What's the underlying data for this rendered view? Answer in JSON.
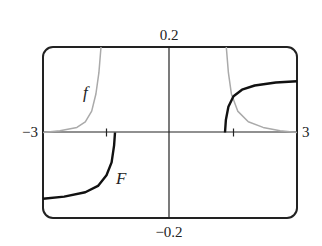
{
  "chart_data": {
    "type": "line",
    "title": "",
    "xlabel": "",
    "ylabel": "",
    "xlim": [
      -3,
      3
    ],
    "ylim": [
      -0.2,
      0.2
    ],
    "grid": false,
    "x_tick_labels": {
      "left": "−3",
      "right": "3"
    },
    "y_tick_labels": {
      "top": "0.2",
      "bottom": "−0.2"
    },
    "x_ticks": [
      -1.5,
      1.5
    ],
    "series": [
      {
        "name": "f",
        "color": "#aaaaaa",
        "segments": [
          [
            [
              -3.0,
              0.0
            ],
            [
              -2.6,
              0.004
            ],
            [
              -2.2,
              0.012
            ],
            [
              -2.0,
              0.025
            ],
            [
              -1.85,
              0.05
            ],
            [
              -1.75,
              0.09
            ],
            [
              -1.68,
              0.14
            ],
            [
              -1.63,
              0.2
            ]
          ],
          [
            [
              1.33,
              0.2
            ],
            [
              1.38,
              0.14
            ],
            [
              1.45,
              0.09
            ],
            [
              1.6,
              0.05
            ],
            [
              1.85,
              0.025
            ],
            [
              2.2,
              0.012
            ],
            [
              2.6,
              0.004
            ],
            [
              3.0,
              0.0
            ]
          ]
        ]
      },
      {
        "name": "F",
        "color": "#111111",
        "segments": [
          [
            [
              -3.0,
              -0.155
            ],
            [
              -2.5,
              -0.15
            ],
            [
              -2.0,
              -0.14
            ],
            [
              -1.7,
              -0.125
            ],
            [
              -1.5,
              -0.1
            ],
            [
              -1.38,
              -0.07
            ],
            [
              -1.32,
              -0.03
            ],
            [
              -1.3,
              0.0
            ]
          ],
          [
            [
              1.3,
              0.0
            ],
            [
              1.32,
              0.03
            ],
            [
              1.38,
              0.06
            ],
            [
              1.5,
              0.085
            ],
            [
              1.7,
              0.1
            ],
            [
              2.0,
              0.11
            ],
            [
              2.5,
              0.117
            ],
            [
              3.0,
              0.12
            ]
          ]
        ]
      }
    ],
    "annotations": [
      {
        "text": "f",
        "x": -2.0,
        "y": 0.08
      },
      {
        "text": "F",
        "x": -1.15,
        "y": -0.12
      }
    ]
  }
}
